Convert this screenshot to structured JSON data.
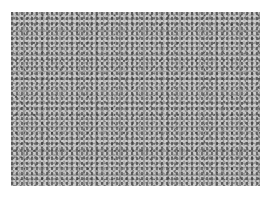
{
  "image": {
    "subject": "gravel texture photograph",
    "style": "grayscale",
    "colors": {
      "background": "#ffffff",
      "base_gray": "#9a9a9a",
      "dark_speckle": "#282828",
      "light_speckle": "#e1e1e1"
    }
  }
}
